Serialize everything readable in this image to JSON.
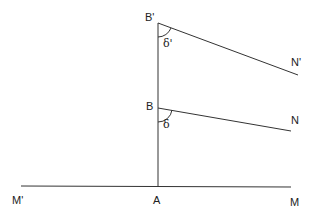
{
  "diagram": {
    "points": {
      "B_prime": {
        "label": "B'",
        "x": 158,
        "y": 23
      },
      "B": {
        "label": "B",
        "x": 158,
        "y": 108
      },
      "A": {
        "label": "A",
        "x": 158,
        "y": 186
      },
      "N_prime": {
        "label": "N'",
        "x": 298,
        "y": 75
      },
      "N": {
        "label": "N",
        "x": 291,
        "y": 131
      },
      "M_prime": {
        "label": "M'",
        "x": 21,
        "y": 186
      },
      "M": {
        "label": "M",
        "x": 291,
        "y": 186
      }
    },
    "angles": {
      "delta_prime": {
        "label": "δ'",
        "vertex": "B'"
      },
      "delta": {
        "label": "δ",
        "vertex": "B"
      }
    },
    "segments": [
      [
        "B'",
        "A"
      ],
      [
        "B'",
        "N'"
      ],
      [
        "B",
        "N"
      ],
      [
        "M'",
        "M"
      ]
    ],
    "line_color": "#333333"
  }
}
